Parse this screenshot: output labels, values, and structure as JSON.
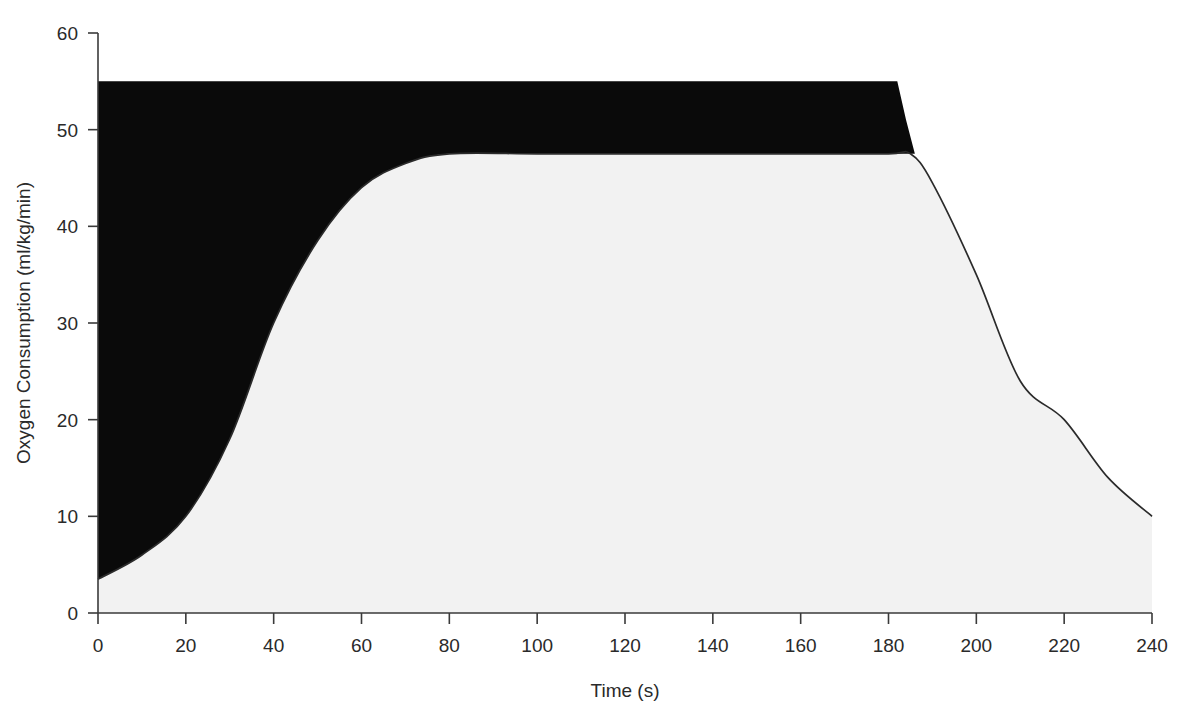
{
  "chart_data": {
    "type": "area",
    "title": "",
    "xlabel": "Time (s)",
    "ylabel": "Oxygen Consumption (ml/kg/min)",
    "xlim": [
      0,
      240
    ],
    "ylim": [
      0,
      60
    ],
    "xticks": [
      0,
      20,
      40,
      60,
      80,
      100,
      120,
      140,
      160,
      180,
      200,
      220,
      240
    ],
    "xtick_labels": [
      "0",
      "20",
      "40",
      "60",
      "80",
      "100",
      "120",
      "140",
      "160",
      "180",
      "200",
      "220",
      "240"
    ],
    "yticks": [
      0,
      10,
      20,
      30,
      40,
      50,
      60
    ],
    "ytick_labels": [
      "0",
      "10",
      "20",
      "30",
      "40",
      "50",
      "60"
    ],
    "grid": false,
    "legend": "none",
    "series": [
      {
        "name": "Oxygen Demand",
        "fill_color": "#0a0a0a",
        "description": "Steady-state oxygen demand during exercise; flat top boundary of the filled black oxygen-deficit region.",
        "x": [
          0,
          20,
          40,
          60,
          80,
          100,
          120,
          140,
          160,
          180,
          182,
          184,
          186
        ],
        "values": [
          55,
          55,
          55,
          55,
          55,
          55,
          55,
          55,
          55,
          55,
          55,
          51,
          47.5
        ]
      },
      {
        "name": "Oxygen Consumption",
        "fill_color": "#f2f2f2",
        "line_color": "#2b2b2b",
        "description": "Measured oxygen uptake: sigmoid on-kinetics rise, steady-state plateau, then recovery decay (EPOC).",
        "x": [
          0,
          10,
          20,
          30,
          40,
          50,
          60,
          70,
          80,
          100,
          120,
          140,
          160,
          180,
          185,
          190,
          200,
          210,
          220,
          230,
          240
        ],
        "values": [
          3.5,
          6,
          10,
          18,
          30,
          38.5,
          44,
          46.5,
          47.5,
          47.5,
          47.5,
          47.5,
          47.5,
          47.5,
          47.5,
          44.5,
          35,
          24,
          20,
          14,
          10
        ]
      }
    ],
    "annotations": [
      {
        "label": "oxygen deficit region",
        "shading": "black",
        "x_range": [
          0,
          186
        ]
      },
      {
        "label": "steady state plateau",
        "value": 47.5,
        "x_range": [
          80,
          185
        ]
      },
      {
        "label": "baseline at rest",
        "value": 3.5,
        "x": 0
      },
      {
        "label": "end recovery value",
        "value": 10,
        "x": 240
      }
    ]
  },
  "axes": {
    "x_axis_title": "Time (s)",
    "y_axis_title": "Oxygen Consumption (ml/kg/min)"
  }
}
